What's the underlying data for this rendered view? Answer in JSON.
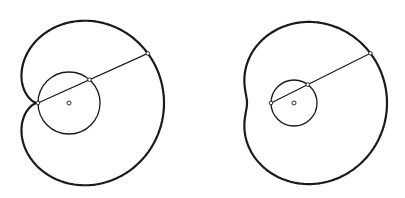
{
  "figures": [
    {
      "name": "limacon-left",
      "center": [
        69,
        103
      ],
      "circle_radius": 31,
      "k": 64,
      "ray_angle_deg": -24.3,
      "stroke_color": "#1a1a1a"
    },
    {
      "name": "limacon-right",
      "center": [
        294,
        103
      ],
      "circle_radius": 23,
      "k": 70,
      "ray_angle_deg": -26.6,
      "stroke_color": "#1a1a1a"
    }
  ]
}
